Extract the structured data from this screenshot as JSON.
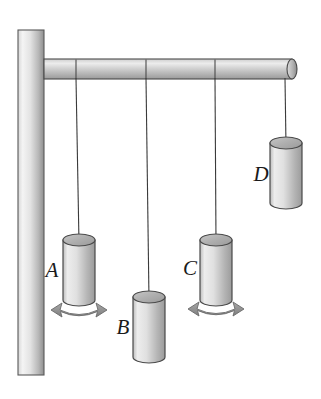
{
  "figure": {
    "background_color": "#ffffff",
    "width": 321,
    "height": 399
  },
  "support": {
    "post": {
      "name": "vertical-wall-post",
      "x": 18,
      "y": 30,
      "width": 26,
      "height": 345,
      "fill_light": "#f2f2f2",
      "fill_dark": "#9a9a9a",
      "stroke": "#555555"
    },
    "rod": {
      "name": "horizontal-rod",
      "x": 44,
      "y": 59,
      "width": 250,
      "height": 20,
      "fill_light": "#e8e8e8",
      "fill_dark": "#9c9c9c",
      "stroke": "#4a4a4a",
      "segment_divider_x": [
        76,
        146,
        215
      ],
      "end_cap_rx": 5,
      "end_cap_ry": 10
    }
  },
  "style": {
    "string_color": "#3a3a3a",
    "string_width": 1.1,
    "cylinder_stroke": "#4a4a4a",
    "cylinder_fill_light": "#ededed",
    "cylinder_fill_dark": "#a2a2a2",
    "cylinder_top_fill": "#b4b4b4",
    "arrow_fill": "#8f8f8f",
    "arrow_stroke": "#6a6a6a",
    "label_color": "#1a1a1a"
  },
  "pendulums": [
    {
      "id": "A",
      "label": "A",
      "anchor_x": 76,
      "anchor_y": 79,
      "bob_cx": 79,
      "bob_top_y": 240,
      "bob_width": 32,
      "bob_height": 60,
      "ellipse_ry": 6,
      "label_x": 52,
      "label_y": 277,
      "has_swing_arrow": true,
      "arrow_cx": 79,
      "arrow_y": 316
    },
    {
      "id": "B",
      "label": "B",
      "anchor_x": 146,
      "anchor_y": 79,
      "bob_cx": 149,
      "bob_top_y": 297,
      "bob_width": 32,
      "bob_height": 60,
      "ellipse_ry": 6,
      "label_x": 123,
      "label_y": 334,
      "has_swing_arrow": false,
      "arrow_cx": 149,
      "arrow_y": 373
    },
    {
      "id": "C",
      "label": "C",
      "anchor_x": 215,
      "anchor_y": 79,
      "bob_cx": 216,
      "bob_top_y": 240,
      "bob_width": 32,
      "bob_height": 60,
      "ellipse_ry": 6,
      "label_x": 190,
      "label_y": 275,
      "has_swing_arrow": true,
      "arrow_cx": 216,
      "arrow_y": 314
    },
    {
      "id": "D",
      "label": "D",
      "anchor_x": 285,
      "anchor_y": 79,
      "bob_cx": 286,
      "bob_top_y": 143,
      "bob_width": 32,
      "bob_height": 60,
      "ellipse_ry": 6,
      "label_x": 261,
      "label_y": 181,
      "has_swing_arrow": false,
      "arrow_cx": 286,
      "arrow_y": 219
    }
  ]
}
